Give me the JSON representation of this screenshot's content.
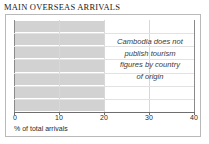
{
  "chart_data": {
    "type": "bar",
    "title": "MAIN OVERSEAS ARRIVALS",
    "xlabel": "% of total arrivals",
    "ylabel": "",
    "xlim": [
      0,
      40
    ],
    "xticks": [
      "0",
      "10",
      "20",
      "30",
      "40"
    ],
    "xtick_values": [
      0,
      10,
      20,
      30,
      40
    ],
    "grid": true,
    "legend": "none",
    "orientation": "horizontal",
    "categories": [
      "",
      "",
      "",
      "",
      "",
      "",
      ""
    ],
    "values": [
      20,
      20,
      20,
      20,
      20,
      20,
      20
    ],
    "bar_color": "#d2d2d2",
    "annotation": {
      "lines": [
        "Cambodia does not",
        "publish tourism",
        "figures by country",
        "of origin"
      ],
      "style": "italic",
      "position": "right-center"
    },
    "note": "No country-of-origin data is plotted; bars are placeholder shading to 20% and the chart carries an explanatory note instead of data."
  },
  "figure": {
    "title": "MAIN OVERSEAS ARRIVALS",
    "axis_caption": "% of total arrivals",
    "ticks": [
      {
        "label": "0",
        "value": 0
      },
      {
        "label": "10",
        "value": 10
      },
      {
        "label": "20",
        "value": 20
      },
      {
        "label": "30",
        "value": 30
      },
      {
        "label": "40",
        "value": 40
      }
    ],
    "annotation_lines": [
      "Cambodia does not",
      "publish tourism",
      "figures by country",
      "of origin"
    ],
    "colors": {
      "band": "#d2d2d2",
      "frame": "#b9b9b9",
      "axis": "#6e6e6e",
      "gridline": "#d8d8d8",
      "text": "#2b2b2b"
    }
  }
}
